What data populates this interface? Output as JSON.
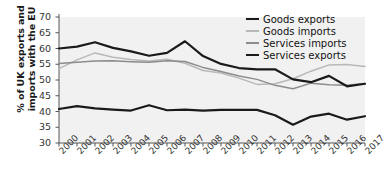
{
  "chart_data": {
    "type": "line",
    "title": "",
    "xlabel": "",
    "ylabel": "% of UK exports and imports with the EU",
    "ylim": [
      30,
      70
    ],
    "ytick_step": 5,
    "yticks": [
      30,
      35,
      40,
      45,
      50,
      55,
      60,
      65,
      70
    ],
    "grid": false,
    "legend_position": "top-right",
    "categories": [
      "2000",
      "2001",
      "2002",
      "2003",
      "2004",
      "2005",
      "2006",
      "2007",
      "2008",
      "2009",
      "2010",
      "2011",
      "2012",
      "2013",
      "2014",
      "2015",
      "2016",
      "2017"
    ],
    "series": [
      {
        "name": "Goods exports",
        "color": "#1a1a1a",
        "width": 2.2,
        "values": [
          60.0,
          60.6,
          62.0,
          60.2,
          59.1,
          57.7,
          58.6,
          62.3,
          57.6,
          55.1,
          53.8,
          53.4,
          53.4,
          50.2,
          49.3,
          51.3,
          48.0,
          48.8
        ]
      },
      {
        "name": "Goods imports",
        "color": "#b8b8b8",
        "width": 1.5,
        "values": [
          53.6,
          56.4,
          58.6,
          57.2,
          56.5,
          56.0,
          56.6,
          55.3,
          53.0,
          52.2,
          50.6,
          48.6,
          48.8,
          50.4,
          52.8,
          54.8,
          54.9,
          54.3
        ]
      },
      {
        "name": "Services imports",
        "color": "#8c8c8c",
        "width": 1.5,
        "values": [
          55.2,
          55.6,
          56.0,
          56.1,
          55.8,
          55.6,
          56.1,
          55.9,
          54.0,
          52.7,
          51.3,
          50.2,
          48.3,
          47.2,
          49.0,
          48.5,
          48.3,
          48.9
        ]
      },
      {
        "name": "Services exports",
        "color": "#1a1a1a",
        "width": 2.2,
        "values": [
          40.8,
          41.7,
          41.0,
          40.6,
          40.3,
          42.0,
          40.4,
          40.6,
          40.3,
          40.5,
          40.5,
          40.5,
          38.8,
          35.8,
          38.4,
          39.3,
          37.4,
          38.5
        ]
      }
    ]
  },
  "legend": {
    "items": [
      {
        "label": "Goods exports"
      },
      {
        "label": "Goods imports"
      },
      {
        "label": "Services imports"
      },
      {
        "label": "Services exports"
      }
    ]
  },
  "axes": {
    "y_title_line1": "% of UK exports and",
    "y_title_line2": "imports with the EU"
  },
  "colors": {
    "plot_background": "#f1f1f1",
    "axis": "#555555",
    "text": "#222222"
  }
}
